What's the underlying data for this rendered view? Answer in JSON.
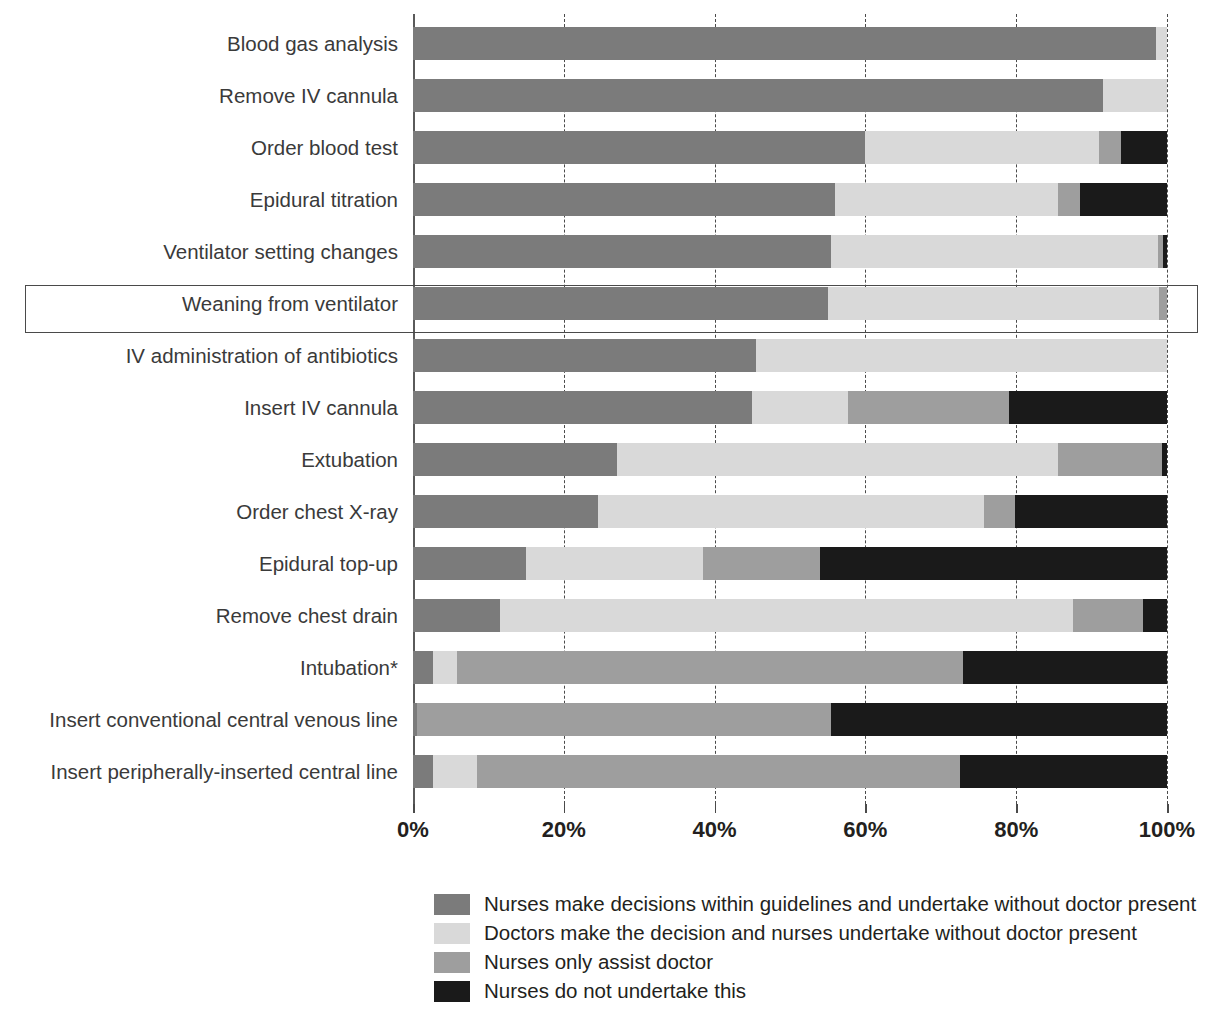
{
  "chart_data": {
    "type": "bar",
    "orientation": "horizontal",
    "stacked": true,
    "normalized": true,
    "title": "",
    "xlabel": "",
    "ylabel": "",
    "xlim": [
      0,
      100
    ],
    "xticks": [
      0,
      20,
      40,
      60,
      80,
      100
    ],
    "xtick_labels": [
      "0%",
      "20%",
      "40%",
      "60%",
      "80%",
      "100%"
    ],
    "grid": "vertical-dashed",
    "legend_position": "bottom-center",
    "highlighted_category": "Weaning from ventilator",
    "footnote_marker": "*",
    "categories": [
      "Blood gas analysis",
      "Remove IV cannula",
      "Order blood test",
      "Epidural titration",
      "Ventilator setting changes",
      "Weaning from ventilator",
      "IV administration of antibiotics",
      "Insert IV cannula",
      "Extubation",
      "Order chest X-ray",
      "Epidural top-up",
      "Remove chest drain",
      "Intubation*",
      "Insert conventional central venous line",
      "Insert peripherally-inserted central line"
    ],
    "series": [
      {
        "name": "Nurses make decisions within guidelines and undertake without doctor present",
        "color": "#7b7b7b",
        "values": [
          98.5,
          91.5,
          60.0,
          56.0,
          55.5,
          55.0,
          45.5,
          45.0,
          27.0,
          24.5,
          15.0,
          11.5,
          2.7,
          0.5,
          2.7
        ]
      },
      {
        "name": "Doctors make the decision and nurses undertake without doctor present",
        "color": "#d9d9d9",
        "values": [
          1.5,
          8.5,
          31.0,
          29.5,
          43.3,
          44.0,
          54.5,
          12.7,
          58.5,
          51.2,
          23.5,
          76.0,
          3.1,
          0.0,
          5.8
        ]
      },
      {
        "name": "Nurses only assist doctor",
        "color": "#9e9e9e",
        "values": [
          0.0,
          0.0,
          2.9,
          3.0,
          0.7,
          1.0,
          0.0,
          21.3,
          13.9,
          4.1,
          15.5,
          9.3,
          67.2,
          55.0,
          64.0
        ]
      },
      {
        "name": "Nurses do not undertake this",
        "color": "#1a1a1a",
        "values": [
          0.0,
          0.0,
          6.1,
          11.5,
          0.5,
          0.0,
          0.0,
          21.0,
          0.6,
          20.2,
          46.0,
          3.2,
          27.0,
          44.5,
          27.5
        ]
      }
    ]
  },
  "legend": {
    "items": [
      {
        "label": "Nurses make decisions within guidelines and undertake without doctor present",
        "color": "#7b7b7b"
      },
      {
        "label": "Doctors make the decision and nurses undertake without doctor present",
        "color": "#d9d9d9"
      },
      {
        "label": "Nurses only assist doctor",
        "color": "#9e9e9e"
      },
      {
        "label": "Nurses do not undertake this",
        "color": "#1a1a1a"
      }
    ]
  },
  "colors": {
    "background": "#ffffff",
    "text": "#231f20",
    "label_text": "#3a3a3a",
    "gridline": "#4a4a4a",
    "axis": "#5a5a5a",
    "highlight_border": "#4a4a4a"
  }
}
